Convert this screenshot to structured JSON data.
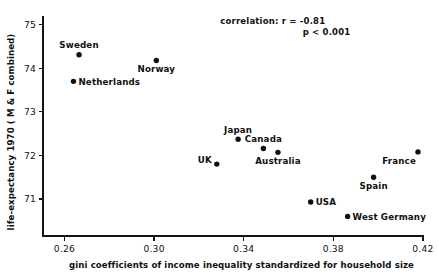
{
  "chart_data": {
    "type": "scatter",
    "title": "",
    "xlabel": "gini coefficients of income inequality standardized  for household size",
    "ylabel": "life-expectancy 1970 ( M & F combined)",
    "xlim": [
      0.2504,
      0.4205
    ],
    "ylim": [
      70.15,
      75.2
    ],
    "xticks": [
      0.26,
      0.3,
      0.34,
      0.38,
      0.42
    ],
    "xticklabels": [
      "0.26",
      "0.30",
      "0.34",
      "0.38",
      "0.42"
    ],
    "yticks": [
      71,
      72,
      73,
      74,
      75
    ],
    "yticklabels": [
      "71",
      "72",
      "73",
      "74",
      "75"
    ],
    "grid": false,
    "legend": false,
    "annotations": [
      {
        "name": "correlation-r",
        "text": "correlation:  r = -0.81",
        "x": 0.353,
        "y": 75.02
      },
      {
        "name": "p-value",
        "text": "p <  0.001",
        "x": 0.377,
        "y": 74.76
      }
    ],
    "points": [
      {
        "label": "Sweden",
        "x": 0.2665,
        "y": 74.31,
        "label_pos": "above"
      },
      {
        "label": "Norway",
        "x": 0.301,
        "y": 74.18,
        "label_pos": "below"
      },
      {
        "label": "Netherlands",
        "x": 0.264,
        "y": 73.7,
        "label_pos": "right"
      },
      {
        "label": "Japan",
        "x": 0.3375,
        "y": 72.37,
        "label_pos": "above"
      },
      {
        "label": "Canada",
        "x": 0.3488,
        "y": 72.16,
        "label_pos": "above"
      },
      {
        "label": "Australia",
        "x": 0.3553,
        "y": 72.07,
        "label_pos": "below"
      },
      {
        "label": "UK",
        "x": 0.328,
        "y": 71.8,
        "label_pos": "left"
      },
      {
        "label": "France",
        "x": 0.4178,
        "y": 72.08,
        "label_pos": "belowleft"
      },
      {
        "label": "Spain",
        "x": 0.398,
        "y": 71.5,
        "label_pos": "below"
      },
      {
        "label": "USA",
        "x": 0.3699,
        "y": 70.93,
        "label_pos": "right"
      },
      {
        "label": "West Germany",
        "x": 0.3864,
        "y": 70.6,
        "label_pos": "right"
      }
    ]
  },
  "style": {
    "ink_color": "#101010",
    "background_color": "#ffffff"
  }
}
